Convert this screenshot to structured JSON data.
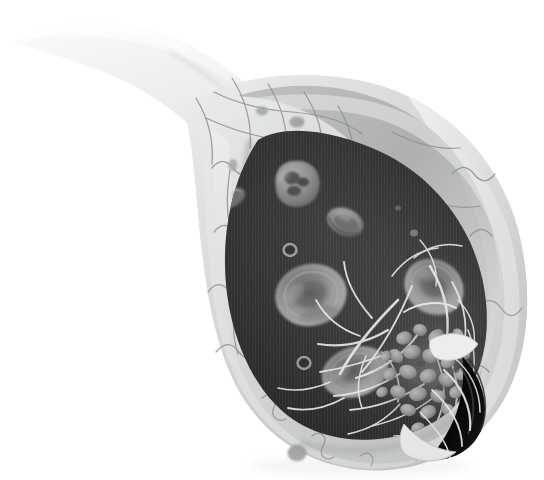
{
  "figure": {
    "title": "Blood vessel cross-section with thrombus formation",
    "style": "grayscale medical illustration",
    "background_color": "#ffffff",
    "canvas": {
      "width": 544,
      "height": 480
    }
  },
  "palette": {
    "background": "#ffffff",
    "lumen_dark": "#262626",
    "lumen_mid": "#3c3c3c",
    "wall_light": "#e2e2e2",
    "wall_mid": "#c8c8c8",
    "wall_shadow": "#a6a6a6",
    "cut_face": "#dedede",
    "cut_face_dark": "#b4b4b4",
    "tail_light": "#f2f2f2",
    "tail_mid": "#d6d6d6",
    "cell_border": "#8f8f8f",
    "rbc_fill": "#8e8e8e",
    "rbc_rim": "#a8a8a8",
    "rbc_center": "#6b6b6b",
    "wbc_fill": "#9a9a9a",
    "wbc_nucleus": "#4a4a4a",
    "platelet": "#9e9e9e",
    "fibrin": "#efefef",
    "rupture_black": "#0c0c0c",
    "nucleus": "#9a9a9a"
  },
  "structures": {
    "vessel_tail": {
      "name": "Tapering vessel neck",
      "description": "Curved light-gray tube sweeping from upper-left to the cut body"
    },
    "vessel_wall": {
      "name": "Vessel wall (endothelium / tunica intima)",
      "description": "Pale gray band with mosaic endothelial cell junctions"
    },
    "cut_face": {
      "name": "Cut-away face",
      "description": "Bright bevelled slab on the right showing wall thickness"
    },
    "lumen": {
      "name": "Vessel lumen",
      "description": "Dark interior filled with plasma and blood cells"
    },
    "rupture": {
      "name": "Vessel wall injury site",
      "description": "Dark torn opening at lower right where the clot seals the breach"
    }
  },
  "cells": {
    "red_blood_cells": [
      {
        "label": "erythrocyte-1",
        "cx": 232,
        "cy": 198,
        "rx": 13,
        "ry": 9,
        "rot": -28,
        "view": "edge"
      },
      {
        "label": "erythrocyte-2",
        "cx": 345,
        "cy": 222,
        "rx": 18,
        "ry": 13,
        "rot": 24,
        "view": "edge"
      },
      {
        "label": "erythrocyte-3",
        "cx": 311,
        "cy": 295,
        "rx": 35,
        "ry": 30,
        "rot": -12,
        "view": "face"
      },
      {
        "label": "erythrocyte-4",
        "cx": 434,
        "cy": 287,
        "rx": 30,
        "ry": 26,
        "rot": 35,
        "view": "face"
      },
      {
        "label": "erythrocyte-5",
        "cx": 355,
        "cy": 372,
        "rx": 33,
        "ry": 24,
        "rot": -18,
        "view": "face"
      }
    ],
    "white_blood_cell": {
      "label": "leukocyte",
      "cx": 297,
      "cy": 184,
      "r": 22,
      "nucleus_lobes": 3,
      "description": "Granulocyte with multilobed nucleus"
    },
    "platelets": [
      {
        "label": "platelet-free-1",
        "cx": 290,
        "cy": 250,
        "r": 6
      },
      {
        "label": "platelet-free-2",
        "cx": 304,
        "cy": 363,
        "r": 6
      },
      {
        "label": "platelet-free-3",
        "cx": 414,
        "cy": 233,
        "r": 4
      }
    ],
    "endothelial_nuclei": [
      {
        "cx": 297,
        "cy": 122,
        "rx": 7,
        "ry": 5
      },
      {
        "cx": 233,
        "cy": 164,
        "rx": 5,
        "ry": 6
      },
      {
        "cx": 297,
        "cy": 454,
        "rx": 9,
        "ry": 8
      },
      {
        "cx": 262,
        "cy": 112,
        "rx": 6,
        "ry": 5
      }
    ]
  },
  "clot": {
    "label": "Platelet plug / thrombus",
    "center": {
      "x": 432,
      "y": 372
    },
    "platelet_count": 34,
    "fibrin_strand_count": 26,
    "description": "Aggregated platelets bound by a mesh of pale fibrin strands sealing the vessel tear"
  },
  "annotations": {
    "has_text_labels": false,
    "has_legend": false,
    "has_scale_bar": false
  }
}
